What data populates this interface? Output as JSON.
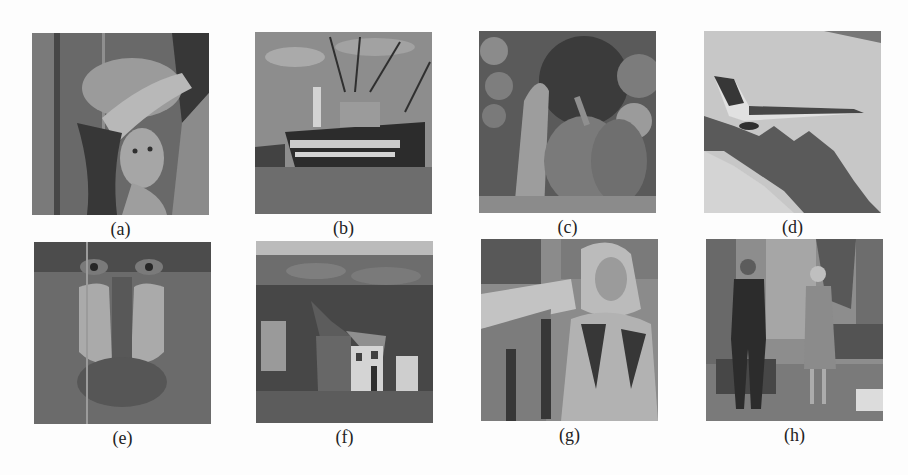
{
  "figure": {
    "panels": [
      {
        "label": "(a)",
        "subject": "woman-with-hat-portrait"
      },
      {
        "label": "(b)",
        "subject": "fishing-boats-harbor"
      },
      {
        "label": "(c)",
        "subject": "peppers"
      },
      {
        "label": "(d)",
        "subject": "fighter-jet-over-mountains"
      },
      {
        "label": "(e)",
        "subject": "mandrill-baboon-face"
      },
      {
        "label": "(f)",
        "subject": "village-street-hillside"
      },
      {
        "label": "(g)",
        "subject": "woman-in-headscarf-seated"
      },
      {
        "label": "(h)",
        "subject": "couple-standing-in-room"
      }
    ]
  }
}
